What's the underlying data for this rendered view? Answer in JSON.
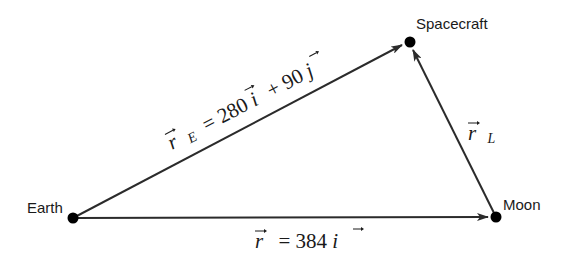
{
  "diagram": {
    "type": "vector-triangle",
    "colors": {
      "line": "#2b2b2b",
      "dot": "#000000",
      "text": "#1a1a1a",
      "background": "#ffffff"
    },
    "nodes": [
      {
        "id": "earth",
        "label": "Earth",
        "x": 73,
        "y": 218
      },
      {
        "id": "moon",
        "label": "Moon",
        "x": 496,
        "y": 217
      },
      {
        "id": "spacecraft",
        "label": "Spacecraft",
        "x": 410,
        "y": 42
      }
    ],
    "edges": [
      {
        "id": "r_E",
        "from": "earth",
        "to": "spacecraft",
        "label": {
          "vec": "r",
          "sub": "E",
          "eq": "= 280",
          "unit1": "i",
          "plus": "+ 90",
          "unit2": "j"
        }
      },
      {
        "id": "r",
        "from": "earth",
        "to": "moon",
        "label": {
          "vec": "r",
          "eq": "= 384",
          "unit1": "i"
        }
      },
      {
        "id": "r_L",
        "from": "moon",
        "to": "spacecraft",
        "label": {
          "vec": "r",
          "sub": "L"
        }
      }
    ]
  }
}
